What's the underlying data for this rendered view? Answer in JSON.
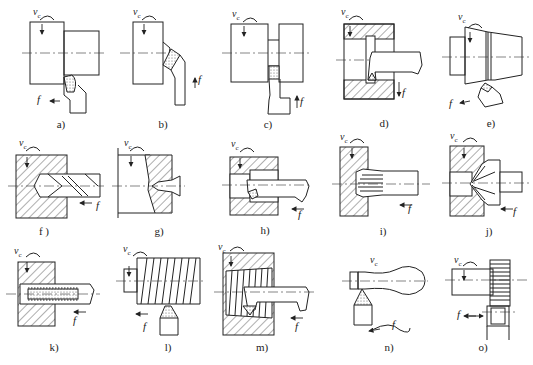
{
  "figure": {
    "symbols": {
      "cutting_speed": "v",
      "cutting_speed_sub": "c",
      "feed": "f"
    },
    "panels": [
      {
        "id": "a",
        "label": "a)",
        "operation": "external turning"
      },
      {
        "id": "b",
        "label": "b)",
        "operation": "facing / chamfer"
      },
      {
        "id": "c",
        "label": "c)",
        "operation": "grooving / parting"
      },
      {
        "id": "d",
        "label": "d)",
        "operation": "internal grooving"
      },
      {
        "id": "e",
        "label": "e)",
        "operation": "taper turning"
      },
      {
        "id": "f",
        "label": "f )",
        "operation": "drilling"
      },
      {
        "id": "g",
        "label": "g)",
        "operation": "center drilling"
      },
      {
        "id": "h",
        "label": "h)",
        "operation": "boring"
      },
      {
        "id": "i",
        "label": "i)",
        "operation": "reaming"
      },
      {
        "id": "j",
        "label": "j)",
        "operation": "countersinking"
      },
      {
        "id": "k",
        "label": "k)",
        "operation": "tapping"
      },
      {
        "id": "l",
        "label": "l)",
        "operation": "external thread turning"
      },
      {
        "id": "m",
        "label": "m)",
        "operation": "internal thread turning"
      },
      {
        "id": "n",
        "label": "n)",
        "operation": "form turning"
      },
      {
        "id": "o",
        "label": "o)",
        "operation": "knurling"
      }
    ]
  }
}
